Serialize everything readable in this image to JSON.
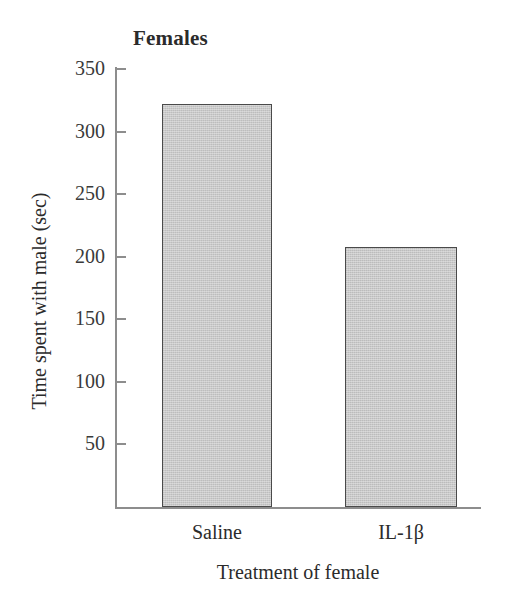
{
  "chart_data": {
    "type": "bar",
    "title": "Females",
    "xlabel": "Treatment of female",
    "ylabel": "Time spent with male (sec)",
    "categories": [
      "Saline",
      "IL-1β"
    ],
    "values": [
      322,
      208
    ],
    "yticks": [
      50,
      100,
      150,
      200,
      250,
      300,
      350
    ],
    "ytick_labels": [
      "50",
      "100",
      "150",
      "200",
      "250",
      "300",
      "350"
    ],
    "ylim": [
      0,
      355
    ],
    "grid": false,
    "legend": null,
    "series": [
      {
        "name": "Time spent with male (sec)",
        "values": [
          322,
          208
        ]
      }
    ],
    "colors": {
      "bar_fill": "#c9c9c9",
      "bar_border": "#4a4a4a",
      "axis": "#8d8d8d",
      "text": "#2b2b2b",
      "background": "#ffffff"
    }
  },
  "axis_geometry": {
    "plot_left": 115,
    "plot_right": 481,
    "plot_top": 67,
    "baseline_y": 507,
    "px_per_unit": 1.2507,
    "bars": [
      {
        "left": 162,
        "width": 110
      },
      {
        "left": 345,
        "width": 112
      }
    ]
  }
}
